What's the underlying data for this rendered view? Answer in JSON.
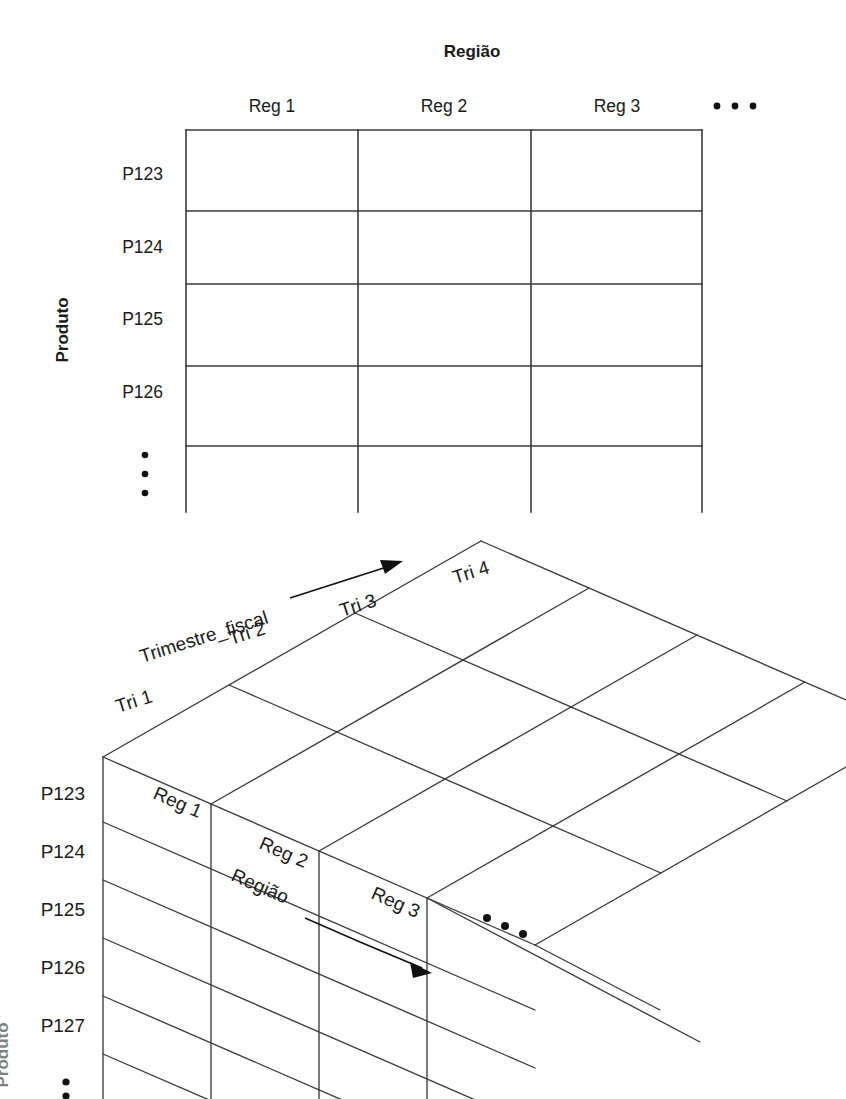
{
  "figure": {
    "caption_top": "Região",
    "caption_left": "Produto"
  },
  "table2d": {
    "column_axis_title": "Região",
    "row_axis_title": "Produto",
    "column_headers": [
      "Reg 1",
      "Reg 2",
      "Reg 3"
    ],
    "column_ellipsis": "• • •",
    "row_headers": [
      "P123",
      "P124",
      "P125",
      "P126"
    ],
    "row_ellipsis": "⋮",
    "cells": [
      [
        "",
        "",
        ""
      ],
      [
        "",
        "",
        ""
      ],
      [
        "",
        "",
        ""
      ],
      [
        "",
        "",
        ""
      ],
      [
        "",
        "",
        ""
      ]
    ]
  },
  "cube3d": {
    "depth_axis_title": "Trimestre_fiscal",
    "depth_labels": [
      "Tri 1",
      "Tri 2",
      "Tri 3",
      "Tri 4"
    ],
    "top_axis_title": "Região",
    "top_labels": [
      "Reg 1",
      "Reg 2",
      "Reg 3"
    ],
    "top_ellipsis": "• • •",
    "row_axis_title": "Produto",
    "row_labels": [
      "P123",
      "P124",
      "P125",
      "P126",
      "P127"
    ],
    "row_ellipsis": "⋮"
  },
  "colors": {
    "line": "#3a3a3a",
    "text": "#1a1a1a",
    "arrow": "#111111",
    "background": "#ffffff"
  }
}
